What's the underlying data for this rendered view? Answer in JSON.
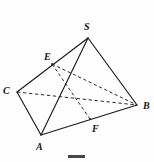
{
  "figure": {
    "kind": "tetrahedron-line-diagram",
    "stroke_color": "#1a1a1a",
    "background_color": "#fefefe",
    "label_color": "#131313",
    "vertices": [
      {
        "id": "S",
        "label": "S",
        "x": 88,
        "y": 38,
        "label_x": 84,
        "label_y": 22
      },
      {
        "id": "C",
        "label": "C",
        "x": 17,
        "y": 92,
        "label_x": 3,
        "label_y": 86
      },
      {
        "id": "B",
        "label": "B",
        "x": 137,
        "y": 105,
        "label_x": 143,
        "label_y": 101
      },
      {
        "id": "A",
        "label": "A",
        "x": 41,
        "y": 135,
        "label_x": 36,
        "label_y": 142
      },
      {
        "id": "E",
        "label": "E",
        "x": 52,
        "y": 64,
        "label_x": 44,
        "label_y": 52
      },
      {
        "id": "F",
        "label": "F",
        "x": 90,
        "y": 119,
        "label_x": 92,
        "label_y": 124
      }
    ],
    "solid_edges": [
      {
        "name": "edge-S-C",
        "from": "S",
        "to": "C"
      },
      {
        "name": "edge-S-B",
        "from": "S",
        "to": "B"
      },
      {
        "name": "edge-S-A",
        "from": "S",
        "to": "A"
      },
      {
        "name": "edge-C-A",
        "from": "C",
        "to": "A"
      },
      {
        "name": "edge-A-B",
        "from": "A",
        "to": "B"
      }
    ],
    "dashed_edges": [
      {
        "name": "edge-C-B-hidden",
        "from": "C",
        "to": "B"
      },
      {
        "name": "edge-E-F-hidden",
        "from": "E",
        "to": "F"
      },
      {
        "name": "edge-E-B-hidden",
        "from": "E",
        "to": "B"
      }
    ],
    "caption": {
      "bar_label": "",
      "text": ""
    }
  }
}
